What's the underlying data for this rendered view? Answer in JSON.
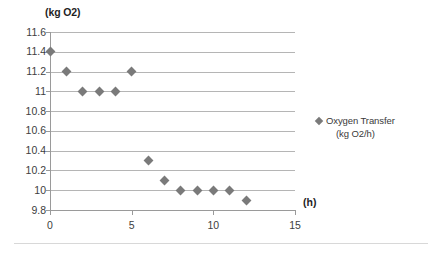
{
  "chart_data": {
    "type": "scatter",
    "title": "",
    "xlabel": "(h)",
    "ylabel": "(kg O2)",
    "xlim": [
      0,
      15
    ],
    "ylim": [
      9.8,
      11.6
    ],
    "x_ticks": [
      "0",
      "5",
      "10",
      "15"
    ],
    "x_tick_values": [
      0,
      5,
      10,
      15
    ],
    "y_ticks": [
      "9.8",
      "10",
      "10.2",
      "10.4",
      "10.6",
      "10.8",
      "11",
      "11.2",
      "11.4",
      "11.6"
    ],
    "y_tick_values": [
      9.8,
      10,
      10.2,
      10.4,
      10.6,
      10.8,
      11,
      11.2,
      11.4,
      11.6
    ],
    "grid": "horizontal",
    "legend_position": "right",
    "marker": "diamond",
    "marker_color": "#7a7a7a",
    "series": [
      {
        "name": "Oxygen Transfer (kg O2/h)",
        "legend_line1": "Oxygen Transfer",
        "legend_line2": "(kg O2/h)",
        "x": [
          0,
          1,
          2,
          3,
          4,
          5,
          6,
          7,
          8,
          9,
          10,
          11,
          12
        ],
        "values": [
          11.4,
          11.2,
          11.0,
          11.0,
          11.0,
          11.2,
          10.3,
          10.1,
          10.0,
          10.0,
          10.0,
          10.0,
          9.9
        ]
      }
    ]
  },
  "axes": {
    "y_title": "(kg O2)",
    "x_title": "(h)"
  },
  "colors": {
    "marker": "#7a7a7a",
    "gridline": "#b5b5b5",
    "axis": "#9a9a9a",
    "text": "#3a3a3a",
    "background": "#ffffff"
  }
}
